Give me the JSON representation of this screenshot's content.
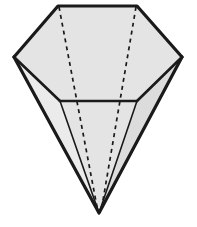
{
  "figure": {
    "name": "hexagonal-pyramid-solid",
    "canvas": {
      "width": 197,
      "height": 227,
      "background_color": "#ffffff"
    },
    "style": {
      "face_fill_color": "#e4e4e4",
      "face_fill_color_light": "#ebebeb",
      "face_fill_color_dark": "#dcdcdc",
      "edge_color": "#1a1a1a",
      "outline_stroke_width": 3.2,
      "interior_stroke_width": 1.6,
      "hidden_edge_color": "#1a1a1a",
      "hidden_edge_stroke_width": 1.7,
      "hidden_edge_dash_pattern": "4 4"
    },
    "vertices": {
      "top_left": {
        "label": "A",
        "x": 58,
        "y": 6
      },
      "top_right": {
        "label": "B",
        "x": 137,
        "y": 6
      },
      "right_side": {
        "label": "C",
        "x": 182,
        "y": 57
      },
      "left_side": {
        "label": "F",
        "x": 14,
        "y": 57
      },
      "mid_left": {
        "label": "E",
        "x": 60,
        "y": 101
      },
      "mid_right": {
        "label": "D",
        "x": 137,
        "y": 101
      },
      "apex": {
        "label": "G",
        "x": 99,
        "y": 213
      }
    },
    "faces": [
      {
        "name": "top-face",
        "points": "58,6 137,6 182,57 137,101 60,101 14,57"
      },
      {
        "name": "lower-left-face",
        "points": "14,57 60,101 99,213"
      },
      {
        "name": "lower-middle-face",
        "points": "60,101 137,101 99,213"
      },
      {
        "name": "lower-right-face",
        "points": "137,101 182,57 99,213"
      }
    ],
    "visible_edges": [
      {
        "name": "top-edge",
        "x1": 58,
        "y1": 6,
        "x2": 137,
        "y2": 6
      },
      {
        "name": "upper-right-edge",
        "x1": 137,
        "y1": 6,
        "x2": 182,
        "y2": 57
      },
      {
        "name": "upper-left-edge",
        "x1": 58,
        "y1": 6,
        "x2": 14,
        "y2": 57
      },
      {
        "name": "right-slant-edge",
        "x1": 182,
        "y1": 57,
        "x2": 137,
        "y2": 101
      },
      {
        "name": "left-slant-edge",
        "x1": 14,
        "y1": 57,
        "x2": 60,
        "y2": 101
      },
      {
        "name": "middle-horizontal-edge",
        "x1": 60,
        "y1": 101,
        "x2": 137,
        "y2": 101
      },
      {
        "name": "lower-left-outline",
        "x1": 14,
        "y1": 57,
        "x2": 99,
        "y2": 213
      },
      {
        "name": "lower-right-outline",
        "x1": 182,
        "y1": 57,
        "x2": 99,
        "y2": 213
      },
      {
        "name": "lower-left-interior",
        "x1": 60,
        "y1": 101,
        "x2": 99,
        "y2": 213
      },
      {
        "name": "lower-right-interior",
        "x1": 137,
        "y1": 101,
        "x2": 99,
        "y2": 213
      }
    ],
    "hidden_edges": [
      {
        "name": "hidden-edge-left",
        "x1": 59,
        "y1": 7,
        "x2": 98,
        "y2": 212
      },
      {
        "name": "hidden-edge-right",
        "x1": 136,
        "y1": 7,
        "x2": 101,
        "y2": 212
      }
    ]
  }
}
